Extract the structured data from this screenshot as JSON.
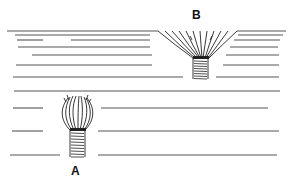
{
  "diagram": {
    "labels": {
      "a": "A",
      "b": "B"
    },
    "colors": {
      "ink": "#222222",
      "line": "#555555",
      "background": "#ffffff"
    },
    "layer_lines": [
      {
        "y": 31,
        "segments": [
          [
            7,
            158
          ],
          [
            237,
            286
          ]
        ]
      },
      {
        "y": 35,
        "segments": [
          [
            15,
            150
          ],
          [
            238,
            283
          ]
        ]
      },
      {
        "y": 40,
        "segments": [
          [
            17,
            43
          ],
          [
            71,
            150
          ],
          [
            234,
            280
          ]
        ]
      },
      {
        "y": 47,
        "segments": [
          [
            18,
            150
          ],
          [
            230,
            278
          ]
        ]
      },
      {
        "y": 55,
        "segments": [
          [
            32,
            152
          ],
          [
            226,
            279
          ]
        ]
      },
      {
        "y": 65,
        "segments": [
          [
            16,
            152
          ],
          [
            223,
            279
          ]
        ]
      },
      {
        "y": 77,
        "segments": [
          [
            13,
            183
          ],
          [
            216,
            279
          ]
        ]
      },
      {
        "y": 91,
        "segments": [
          [
            14,
            280
          ]
        ]
      },
      {
        "y": 108,
        "segments": [
          [
            13,
            43
          ],
          [
            101,
            268
          ]
        ]
      },
      {
        "y": 131,
        "segments": [
          [
            12,
            43
          ],
          [
            98,
            279
          ]
        ]
      },
      {
        "y": 155,
        "segments": [
          [
            10,
            60
          ],
          [
            98,
            277
          ]
        ]
      }
    ],
    "structure_a": {
      "label_pos": [
        71,
        165
      ],
      "bulb": {
        "cx": 77,
        "top": 96,
        "bottom": 130,
        "width": 28
      },
      "stem": {
        "x": 70,
        "y": 130,
        "w": 15,
        "h": 27
      }
    },
    "structure_b": {
      "label_pos": [
        192,
        9
      ],
      "rim": {
        "y": 31,
        "x1": 158,
        "x2": 237
      },
      "neck": {
        "x1": 193,
        "x2": 209,
        "y": 58
      },
      "stem": {
        "x": 193,
        "y": 58,
        "w": 15,
        "h": 21
      }
    }
  }
}
